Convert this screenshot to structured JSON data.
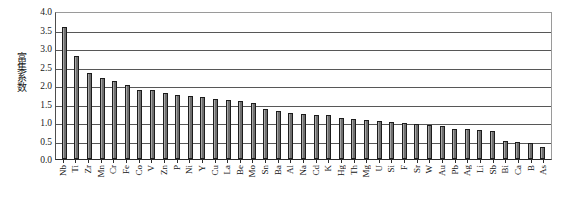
{
  "chart_data": {
    "type": "bar",
    "title": "",
    "xlabel": "",
    "ylabel": "富集系数",
    "ylim": [
      0.0,
      4.0
    ],
    "ytick_labels": [
      "4.0",
      "3.5",
      "3.0",
      "2.5",
      "2.0",
      "1.5",
      "1.0",
      "0.5",
      "0.0"
    ],
    "ytick_values": [
      4.0,
      3.5,
      3.0,
      2.5,
      2.0,
      1.5,
      1.0,
      0.5,
      0.0
    ],
    "grid": true,
    "grid_axis": "y",
    "legend": false,
    "categories": [
      "Nb",
      "Ti",
      "Zr",
      "Mn",
      "Cr",
      "Fe",
      "Co",
      "V",
      "Zn",
      "P",
      "Ni",
      "Y",
      "Cu",
      "La",
      "Be",
      "Mo",
      "Sn",
      "Ba",
      "Al",
      "Na",
      "Cd",
      "K",
      "Hg",
      "Th",
      "Mg",
      "U",
      "Si",
      "F",
      "Sr",
      "W",
      "Au",
      "Pb",
      "Ag",
      "Li",
      "Sb",
      "Bi",
      "Ca",
      "B",
      "As"
    ],
    "values": [
      3.58,
      2.78,
      2.33,
      2.2,
      2.1,
      2.0,
      1.87,
      1.87,
      1.78,
      1.72,
      1.7,
      1.68,
      1.63,
      1.6,
      1.57,
      1.52,
      1.35,
      1.3,
      1.25,
      1.22,
      1.2,
      1.18,
      1.1,
      1.08,
      1.05,
      1.02,
      1.0,
      0.98,
      0.95,
      0.93,
      0.9,
      0.82,
      0.8,
      0.78,
      0.75,
      0.48,
      0.45,
      0.42,
      0.32
    ],
    "bar_color": "#6e6e6e",
    "bar_edge_color": "#1c1c1c",
    "axis_color": "#2b2b2b",
    "grid_color": "#575757",
    "background": "#ffffff"
  }
}
